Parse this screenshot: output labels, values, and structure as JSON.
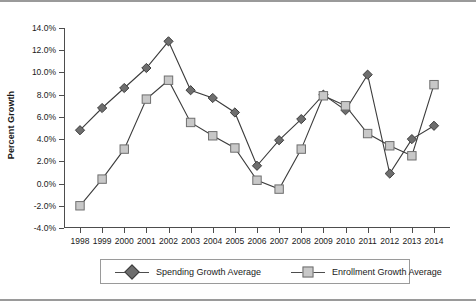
{
  "chart_data": {
    "type": "line",
    "title": "",
    "xlabel": "",
    "ylabel": "Percent Growth",
    "categories": [
      "1998",
      "1999",
      "2000",
      "2001",
      "2002",
      "2003",
      "2004",
      "2005",
      "2006",
      "2007",
      "2008",
      "2009",
      "2010",
      "2011",
      "2012",
      "2013",
      "2014"
    ],
    "ylim": [
      -4.0,
      14.0
    ],
    "ytick_labels": [
      "14.0%",
      "12.0%",
      "10.0%",
      "8.0%",
      "6.0%",
      "4.0%",
      "2.0%",
      "0.0%",
      "-2.0%",
      "-4.0%"
    ],
    "ytick_values": [
      14.0,
      12.0,
      10.0,
      8.0,
      6.0,
      4.0,
      2.0,
      0.0,
      -2.0,
      -4.0
    ],
    "grid": false,
    "legend_position": "bottom",
    "series": [
      {
        "name": "Spending Growth Average",
        "marker": "diamond",
        "color": "#6e6e6e",
        "edge_color": "#3c3c3c",
        "values": [
          4.8,
          6.8,
          8.6,
          10.4,
          12.8,
          8.4,
          7.7,
          6.4,
          1.6,
          3.9,
          5.8,
          8.0,
          6.6,
          9.8,
          0.9,
          4.0,
          5.2
        ]
      },
      {
        "name": "Enrollment Growth Average",
        "marker": "square",
        "color": "#c8c8c8",
        "edge_color": "#6f6f6f",
        "values": [
          -2.0,
          0.4,
          3.1,
          7.6,
          9.3,
          5.5,
          4.3,
          3.2,
          0.3,
          -0.5,
          3.1,
          7.9,
          7.0,
          4.5,
          3.4,
          2.5,
          8.9
        ]
      }
    ]
  },
  "legend": {
    "items": [
      {
        "label": "Spending Growth Average"
      },
      {
        "label": "Enrollment Growth Average"
      }
    ]
  }
}
